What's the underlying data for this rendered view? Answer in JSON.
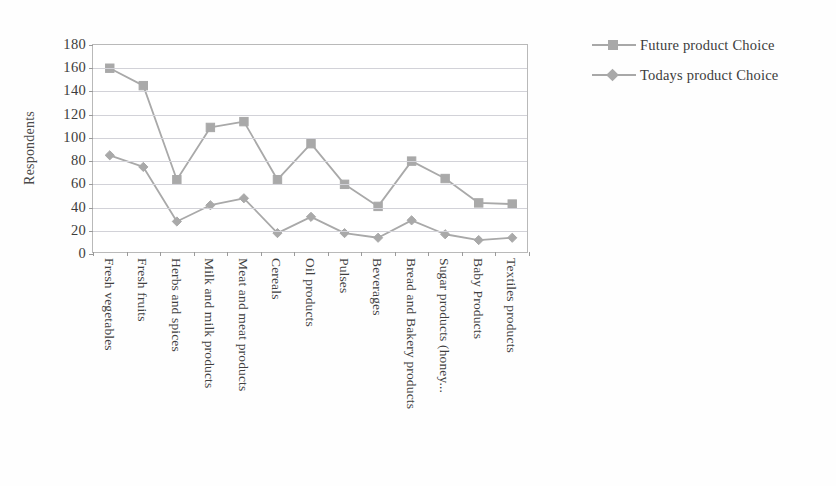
{
  "chart_data": {
    "type": "line",
    "title": "",
    "xlabel": "",
    "ylabel": "Respondents",
    "ylim": [
      0,
      180
    ],
    "ytick_step": 20,
    "yticks": [
      180,
      160,
      140,
      120,
      100,
      80,
      60,
      40,
      20,
      0
    ],
    "grid": true,
    "legend_position": "right",
    "categories": [
      "Fresh vegetables",
      "Fresh fruits",
      "Herbs and spices",
      "Milk and milk products",
      "Meat and meat products",
      "Cereals",
      "Oil products",
      "Pulses",
      "Beverages",
      "Bread and Bakery products",
      "Sugar products (honey...",
      "Baby Products",
      "Textiles products"
    ],
    "series": [
      {
        "name": "Future product Choice",
        "marker": "square",
        "color": "#a9a9a9",
        "values": [
          160,
          145,
          64,
          109,
          114,
          64,
          95,
          60,
          41,
          80,
          65,
          44,
          43
        ]
      },
      {
        "name": "Todays product Choice",
        "marker": "diamond",
        "color": "#a9a9a9",
        "values": [
          85,
          75,
          28,
          42,
          48,
          18,
          32,
          18,
          14,
          29,
          17,
          12,
          14
        ]
      }
    ]
  },
  "axis": {
    "y_title": "Respondents"
  },
  "legend": {
    "items": [
      {
        "label": "Future product Choice",
        "marker": "square"
      },
      {
        "label": "Todays product Choice",
        "marker": "diamond"
      }
    ]
  },
  "colors": {
    "series_gray": "#a9a9a9",
    "gridline": "#d2d2d8",
    "frame": "#b9b9b9",
    "text": "#3c3c3c",
    "background": "#ffffff"
  }
}
